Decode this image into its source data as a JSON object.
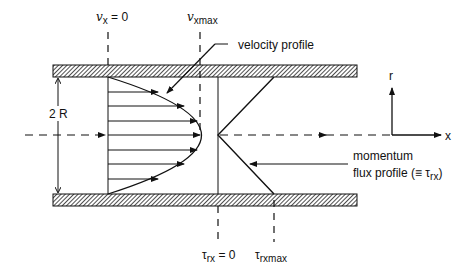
{
  "diagram": {
    "labels": {
      "vx_zero": {
        "symbol": "v",
        "sub": "x",
        "suffix": " = 0"
      },
      "vx_max": {
        "symbol": "v",
        "sub": "xmax"
      },
      "velocity_profile": "velocity profile",
      "gap": "2 R",
      "axis_r": "r",
      "axis_x": "x",
      "momentum_line1": "momentum",
      "momentum_line2": "flux profile  (≡ τ",
      "momentum_sub": "rx",
      "momentum_close": ")",
      "tau_zero": {
        "symbol": "τ",
        "sub": "rx",
        "suffix": " = 0"
      },
      "tau_max": {
        "symbol": "τ",
        "sub": "rxmax"
      }
    },
    "colors": {
      "ink": "#111111",
      "background": "#ffffff"
    },
    "icons": [
      "hatched-plate-top",
      "hatched-plate-bottom",
      "parabolic-velocity-curve",
      "v-shaped-flux-profile",
      "coordinate-axes"
    ]
  }
}
